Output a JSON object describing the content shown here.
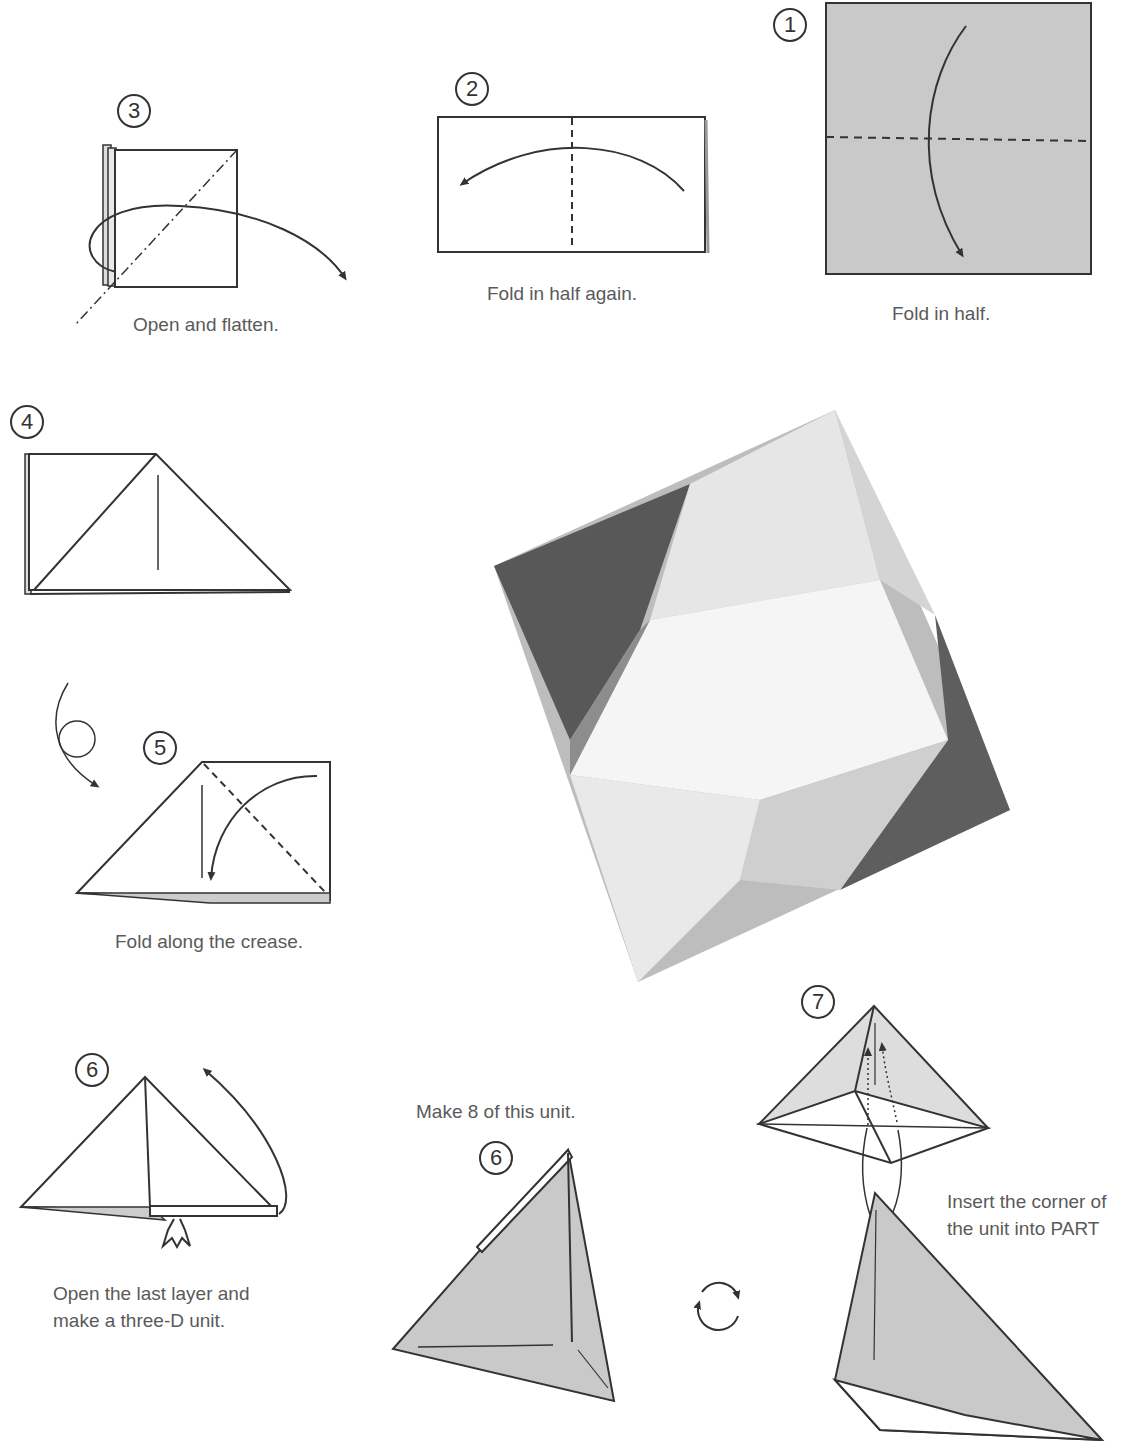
{
  "steps": [
    {
      "number": "1",
      "caption": "Fold in half."
    },
    {
      "number": "2",
      "caption": "Fold in half again."
    },
    {
      "number": "3",
      "caption": "Open and flatten."
    },
    {
      "number": "4",
      "caption": ""
    },
    {
      "number": "5",
      "caption": "Fold along the crease."
    },
    {
      "number": "6",
      "caption_line1": "Open the last layer and",
      "caption_line2": "make a three-D unit."
    },
    {
      "number": "6",
      "caption": "Make 8 of this unit."
    },
    {
      "number": "7",
      "caption_line1": "Insert the corner of",
      "caption_line2": "the unit into PART"
    }
  ],
  "photo": {
    "subject": "assembled origami octahedron"
  },
  "colors": {
    "paper_gray": "#c9c9c9",
    "line": "#333333",
    "text": "#5a5a5a"
  }
}
